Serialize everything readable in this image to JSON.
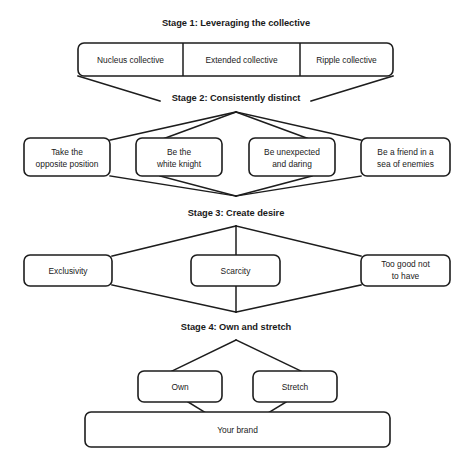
{
  "diagram": {
    "background_color": "#ffffff",
    "line_color": "#1d1d1d",
    "text_color": "#1a1a1a",
    "stages": [
      {
        "id": "stage-1",
        "heading": "Stage 1: Leveraging the collective",
        "nodes": [
          {
            "id": "nucleus-collective",
            "label": "Nucleus collective"
          },
          {
            "id": "extended-collective",
            "label": "Extended collective"
          },
          {
            "id": "ripple-collective",
            "label": "Ripple collective"
          }
        ]
      },
      {
        "id": "stage-2",
        "heading": "Stage 2: Consistently distinct",
        "nodes": [
          {
            "id": "take-the-opposite-position",
            "line1": "Take the",
            "line2": "opposite position"
          },
          {
            "id": "be-the-white-knight",
            "line1": "Be the",
            "line2": "white knight"
          },
          {
            "id": "be-unexpected-and-daring",
            "line1": "Be unexpected",
            "line2": "and daring"
          },
          {
            "id": "be-a-friend-in-a-sea-of-enemies",
            "line1": "Be a friend in a",
            "line2": "sea of enemies"
          }
        ]
      },
      {
        "id": "stage-3",
        "heading": "Stage 3: Create desire",
        "nodes": [
          {
            "id": "exclusivity",
            "line1": "Exclusivity",
            "line2": ""
          },
          {
            "id": "scarcity",
            "line1": "Scarcity",
            "line2": ""
          },
          {
            "id": "too-good-not-to-have",
            "line1": "Too good not",
            "line2": "to have"
          }
        ]
      },
      {
        "id": "stage-4",
        "heading": "Stage 4: Own and stretch",
        "nodes": [
          {
            "id": "own",
            "label": "Own"
          },
          {
            "id": "stretch",
            "label": "Stretch"
          },
          {
            "id": "your-brand",
            "label": "Your brand"
          }
        ]
      }
    ]
  }
}
